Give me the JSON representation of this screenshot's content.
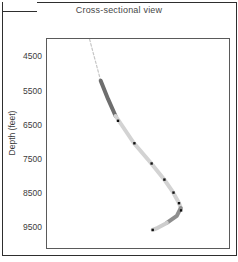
{
  "panel": {
    "label": "b."
  },
  "chart_data": {
    "type": "line",
    "title": "Cross-sectional view",
    "ylabel": "Depth (feet)",
    "xlabel": "",
    "yticks": [
      4500,
      5500,
      6500,
      7500,
      8500,
      9500
    ],
    "ylim": [
      3950,
      10060
    ],
    "y_inverted": true,
    "x_axis_labeled": false,
    "x_scale": "fraction-of-plot-width",
    "grid": false,
    "legend": false,
    "series": [
      {
        "name": "upper-section-dashed",
        "style": "dashed",
        "width": 1.2,
        "color": "#c6c6c6",
        "points": [
          [
            0.234,
            3960
          ],
          [
            0.262,
            4520
          ],
          [
            0.295,
            5170
          ]
        ]
      },
      {
        "name": "build-section-dark",
        "style": "solid",
        "width": 4,
        "color": "#6e6e6e",
        "points": [
          [
            0.295,
            5170
          ],
          [
            0.335,
            5700
          ],
          [
            0.377,
            6200
          ]
        ]
      },
      {
        "name": "build-section-light",
        "style": "solid",
        "width": 4,
        "color": "#d3d3d3",
        "points": [
          [
            0.377,
            6200
          ],
          [
            0.477,
            6990
          ],
          [
            0.57,
            7570
          ],
          [
            0.642,
            8040
          ],
          [
            0.691,
            8420
          ],
          [
            0.724,
            8740
          ],
          [
            0.735,
            8890
          ]
        ]
      },
      {
        "name": "hook-section-dark",
        "style": "solid",
        "width": 4,
        "color": "#8e8e8e",
        "points": [
          [
            0.735,
            8890
          ],
          [
            0.713,
            9120
          ],
          [
            0.658,
            9325
          ]
        ]
      },
      {
        "name": "hook-end-light",
        "style": "solid",
        "width": 4,
        "color": "#cdcdcd",
        "points": [
          [
            0.658,
            9325
          ],
          [
            0.609,
            9470
          ],
          [
            0.581,
            9530
          ]
        ]
      }
    ],
    "markers": {
      "name": "survey-points",
      "color": "#111111",
      "size": 2.4,
      "points": [
        [
          0.39,
          6340
        ],
        [
          0.48,
          7000
        ],
        [
          0.575,
          7590
        ],
        [
          0.645,
          8060
        ],
        [
          0.695,
          8440
        ],
        [
          0.725,
          8750
        ],
        [
          0.737,
          8960
        ],
        [
          0.581,
          9530
        ]
      ]
    },
    "colors": {
      "frame": "#2e2e2e",
      "axis": "#5a5a5a",
      "text": "#3c3c3c",
      "background": "#ffffff"
    }
  }
}
